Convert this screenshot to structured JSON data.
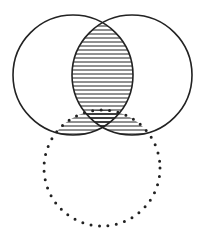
{
  "diagram": {
    "type": "venn",
    "stroke_color": "#222222",
    "background": "#ffffff",
    "circles": [
      {
        "id": "left",
        "cx": 73,
        "cy": 75,
        "r": 60,
        "style": "solid"
      },
      {
        "id": "right",
        "cx": 132,
        "cy": 75,
        "r": 60,
        "style": "solid"
      },
      {
        "id": "bottom",
        "cx": 102,
        "cy": 168,
        "r": 58,
        "style": "dotted"
      }
    ],
    "hatched_regions": [
      "left ∩ right",
      "bottom ∩ (left ∪ right)"
    ]
  }
}
